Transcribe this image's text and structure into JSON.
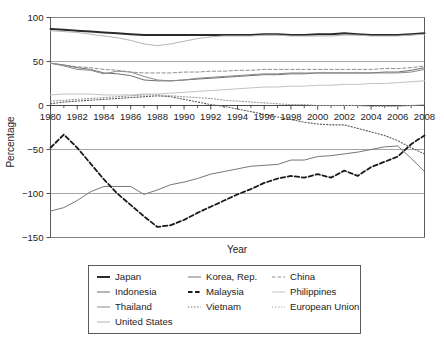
{
  "chart_data": {
    "type": "line",
    "title": "",
    "xlabel": "Year",
    "ylabel": "Percentage",
    "xlim": [
      1980,
      2008
    ],
    "ylim": [
      -150,
      100
    ],
    "grid": true,
    "grid_axis": "y",
    "legend_position": "below-center",
    "legend_columns": 3,
    "x_tick_labels": [
      "1980",
      "1982",
      "1984",
      "1986",
      "1988",
      "1990",
      "1992",
      "1994",
      "1996",
      "1998",
      "2000",
      "2002",
      "2004",
      "2006",
      "2008"
    ],
    "x_tick_values": [
      1980,
      1982,
      1984,
      1986,
      1988,
      1990,
      1992,
      1994,
      1996,
      1998,
      2000,
      2002,
      2004,
      2006,
      2008
    ],
    "x_minor_ticks": [
      1981,
      1983,
      1985,
      1987,
      1989,
      1991,
      1993,
      1995,
      1997,
      1999,
      2001,
      2003,
      2005,
      2007
    ],
    "y_tick_labels": [
      "100",
      "50",
      "0",
      "-50",
      "-100",
      "-150"
    ],
    "y_tick_values": [
      100,
      50,
      0,
      -50,
      -100,
      -150
    ],
    "x": [
      1980,
      1981,
      1982,
      1983,
      1984,
      1985,
      1986,
      1987,
      1988,
      1989,
      1990,
      1991,
      1992,
      1993,
      1994,
      1995,
      1996,
      1997,
      1998,
      1999,
      2000,
      2001,
      2002,
      2003,
      2004,
      2005,
      2006,
      2007,
      2008
    ],
    "series": [
      {
        "name": "Japan",
        "style": "solid",
        "color": "#2b2b2b",
        "width": 2.0,
        "values": [
          87,
          86,
          85,
          84,
          83,
          82,
          81,
          80,
          80,
          80,
          80,
          80,
          80,
          80,
          80,
          80,
          81,
          81,
          80,
          80,
          81,
          81,
          82,
          81,
          80,
          80,
          80,
          81,
          82
        ]
      },
      {
        "name": "Indonesia",
        "style": "solid",
        "color": "#6e6e6e",
        "width": 1.0,
        "values": [
          48,
          46,
          43,
          41,
          37,
          36,
          34,
          29,
          28,
          28,
          29,
          30,
          31,
          32,
          33,
          34,
          35,
          35,
          36,
          36,
          37,
          37,
          37,
          37,
          37,
          38,
          38,
          40,
          43
        ]
      },
      {
        "name": "Thailand",
        "style": "solid",
        "color": "#8c8c8c",
        "width": 1.0,
        "values": [
          48,
          45,
          41,
          40,
          36,
          39,
          38,
          33,
          29,
          28,
          29,
          31,
          32,
          33,
          34,
          35,
          36,
          36,
          37,
          37,
          37,
          37,
          37,
          37,
          37,
          37,
          37,
          38,
          41
        ]
      },
      {
        "name": "United States",
        "style": "solid",
        "color": "#b5b5b5",
        "width": 1.0,
        "values": [
          85,
          84,
          83,
          81,
          79,
          77,
          74,
          70,
          68,
          70,
          73,
          76,
          78,
          79,
          79,
          79,
          80,
          80,
          79,
          79,
          79,
          79,
          80,
          80,
          79,
          79,
          79,
          80,
          81
        ]
      },
      {
        "name": "Korea, Rep.",
        "style": "solid",
        "color": "#777777",
        "width": 1.0,
        "values": [
          -120,
          -116,
          -108,
          -98,
          -92,
          -92,
          -92,
          -101,
          -96,
          -90,
          -87,
          -83,
          -78,
          -75,
          -72,
          -69,
          -68,
          -67,
          -62,
          -62,
          -58,
          -57,
          -55,
          -53,
          -50,
          -47,
          -46,
          -60,
          -75
        ]
      },
      {
        "name": "Malaysia",
        "style": "dashed",
        "color": "#1a1a1a",
        "width": 1.8,
        "values": [
          -48,
          -33,
          -48,
          -66,
          -84,
          -100,
          -113,
          -126,
          -138,
          -136,
          -130,
          -122,
          -115,
          -108,
          -101,
          -95,
          -88,
          -83,
          -80,
          -82,
          -78,
          -82,
          -74,
          -80,
          -70,
          -64,
          -58,
          -44,
          -34
        ]
      },
      {
        "name": "Vietnam",
        "style": "dotted",
        "color": "#5a5a5a",
        "width": 1.1,
        "values": [
          2,
          4,
          5,
          6,
          7,
          8,
          9,
          10,
          11,
          10,
          7,
          4,
          1,
          -1,
          -4,
          -7,
          -10,
          -13,
          -16,
          -19,
          -21,
          -22,
          -22,
          -26,
          -30,
          -34,
          -40,
          -48,
          -55
        ]
      },
      {
        "name": "China",
        "style": "dashed",
        "color": "#909090",
        "width": 1.0,
        "values": [
          48,
          46,
          44,
          43,
          41,
          40,
          38,
          37,
          37,
          37,
          38,
          38,
          39,
          39,
          40,
          40,
          41,
          41,
          41,
          41,
          41,
          41,
          41,
          41,
          41,
          42,
          42,
          43,
          45
        ]
      },
      {
        "name": "Philippines",
        "style": "solid",
        "color": "#c2c2c2",
        "width": 1.0,
        "values": [
          12,
          13,
          13,
          13,
          12,
          12,
          12,
          13,
          13,
          14,
          15,
          16,
          17,
          18,
          19,
          20,
          21,
          21,
          22,
          22,
          23,
          23,
          24,
          24,
          25,
          25,
          26,
          27,
          28
        ]
      },
      {
        "name": "European Union",
        "style": "dotted",
        "color": "#9c9c9c",
        "width": 1.1,
        "values": [
          5,
          6,
          7,
          8,
          9,
          10,
          11,
          12,
          12,
          11,
          10,
          9,
          8,
          6,
          5,
          4,
          3,
          2,
          1,
          1,
          0,
          0,
          0,
          0,
          -1,
          -1,
          -1,
          0,
          1
        ]
      }
    ],
    "legend_entries": [
      {
        "label": "Japan",
        "style": "solid",
        "color": "#2b2b2b",
        "width": 2.0,
        "col": 0,
        "row": 0
      },
      {
        "label": "Indonesia",
        "style": "solid",
        "color": "#6e6e6e",
        "width": 1.0,
        "col": 0,
        "row": 1
      },
      {
        "label": "Thailand",
        "style": "solid",
        "color": "#8c8c8c",
        "width": 1.0,
        "col": 0,
        "row": 2
      },
      {
        "label": "United States",
        "style": "solid",
        "color": "#b5b5b5",
        "width": 1.0,
        "col": 0,
        "row": 3
      },
      {
        "label": "Korea, Rep.",
        "style": "solid",
        "color": "#777777",
        "width": 1.0,
        "col": 1,
        "row": 0
      },
      {
        "label": "Malaysia",
        "style": "dashed",
        "color": "#1a1a1a",
        "width": 1.8,
        "col": 1,
        "row": 1
      },
      {
        "label": "Vietnam",
        "style": "dotted",
        "color": "#5a5a5a",
        "width": 1.1,
        "col": 1,
        "row": 2
      },
      {
        "label": "China",
        "style": "dashed",
        "color": "#909090",
        "width": 1.0,
        "col": 2,
        "row": 0
      },
      {
        "label": "Philippines",
        "style": "solid",
        "color": "#c2c2c2",
        "width": 1.0,
        "col": 2,
        "row": 1
      },
      {
        "label": "European Union",
        "style": "dotted",
        "color": "#9c9c9c",
        "width": 1.1,
        "col": 2,
        "row": 2
      }
    ]
  }
}
